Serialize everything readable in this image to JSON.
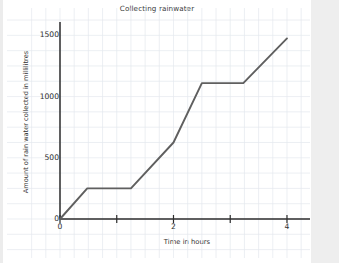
{
  "chart_data": {
    "type": "line",
    "title": "Collecting rainwater",
    "xlabel": "Time in hours",
    "ylabel": "Amount of rain water collected in millilitres",
    "xlim": [
      0,
      4.3
    ],
    "ylim": [
      0,
      1560
    ],
    "grid": true,
    "legend": "none",
    "x_ticks": [
      0,
      1,
      2,
      3,
      4
    ],
    "x_tick_labels": [
      "0",
      "",
      "2",
      "",
      "4"
    ],
    "y_ticks": [
      0,
      500,
      1000,
      1500
    ],
    "y_tick_labels": [
      "0",
      "500",
      "1000",
      "1500"
    ],
    "series": [
      {
        "name": "Rain water collected",
        "color": "#5f5f5f",
        "x": [
          0,
          0.48,
          1.25,
          2.0,
          2.5,
          3.23,
          4.0
        ],
        "y": [
          0,
          250,
          250,
          625,
          1110,
          1110,
          1475
        ]
      }
    ],
    "annotations": []
  },
  "figure": {
    "title": "Collecting rainwater",
    "x_axis_label": "Time in hours",
    "y_axis_label": "Amount of rain water collected in millilitres"
  },
  "colors": {
    "line": "#5f5f5f",
    "axis": "#2d2d2d",
    "grid": "#e4e8ee",
    "background": "#ffffff",
    "text": "#333333"
  }
}
